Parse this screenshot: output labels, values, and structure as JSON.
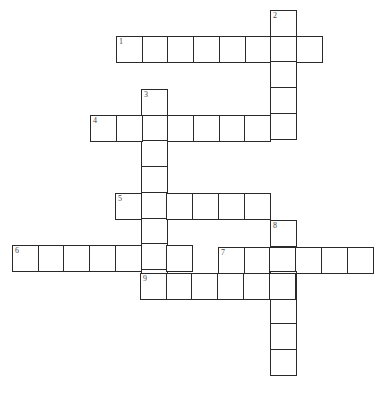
{
  "puzzle": {
    "type": "crossword",
    "cell_size": 25.7,
    "entries": [
      {
        "number": "1",
        "direction": "across",
        "x": 116,
        "y": 36,
        "length": 8
      },
      {
        "number": "2",
        "direction": "down",
        "x": 270,
        "y": 10,
        "length": 5
      },
      {
        "number": "3",
        "direction": "down",
        "x": 141,
        "y": 89,
        "length": 8
      },
      {
        "number": "4",
        "direction": "across",
        "x": 90,
        "y": 115,
        "length": 8
      },
      {
        "number": "5",
        "direction": "across",
        "x": 115,
        "y": 193,
        "length": 6
      },
      {
        "number": "6",
        "direction": "across",
        "x": 12,
        "y": 245,
        "length": 7
      },
      {
        "number": "7",
        "direction": "across",
        "x": 218,
        "y": 247,
        "length": 6
      },
      {
        "number": "8",
        "direction": "down",
        "x": 270,
        "y": 220,
        "length": 6
      },
      {
        "number": "9",
        "direction": "across",
        "x": 140,
        "y": 273,
        "length": 6
      }
    ]
  }
}
